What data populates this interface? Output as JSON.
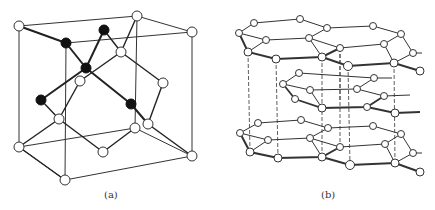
{
  "figure": {
    "panels": [
      {
        "id": "a",
        "label": "(a)",
        "title": "diamond cubic lattice",
        "label_x": 104,
        "label_y": 189
      },
      {
        "id": "b",
        "label": "(b)",
        "title": "graphite layered hexagonal lattice",
        "label_x": 321,
        "label_y": 189
      }
    ],
    "colors": {
      "line": "#2a2a2a",
      "atom_fill": "#ffffff",
      "atom_dark": "#111111"
    }
  }
}
